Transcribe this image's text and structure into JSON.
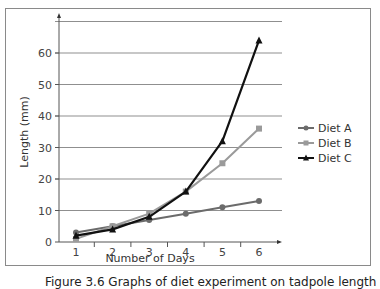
{
  "chart_data": {
    "type": "line",
    "title": "",
    "xlabel": "Number of Days",
    "ylabel": "Length (mm)",
    "categories": [
      "1",
      "2",
      "3",
      "4",
      "5",
      "6"
    ],
    "x": [
      1,
      2,
      3,
      4,
      5,
      6
    ],
    "yticks": [
      0,
      10,
      20,
      30,
      40,
      50,
      60
    ],
    "ylim": [
      0,
      70
    ],
    "grid": true,
    "legend_position": "right",
    "series": [
      {
        "name": "Diet A",
        "values": [
          3,
          5,
          7,
          9,
          11,
          13
        ],
        "color": "#6b6b6b",
        "marker": "circle"
      },
      {
        "name": "Diet B",
        "values": [
          1,
          5,
          9,
          16,
          25,
          36
        ],
        "color": "#9a9a9a",
        "marker": "square"
      },
      {
        "name": "Diet C",
        "values": [
          2,
          4,
          8,
          16,
          32,
          64
        ],
        "color": "#111111",
        "marker": "triangle"
      }
    ]
  },
  "caption": "Figure 3.6 Graphs of diet experiment on tadpole length"
}
